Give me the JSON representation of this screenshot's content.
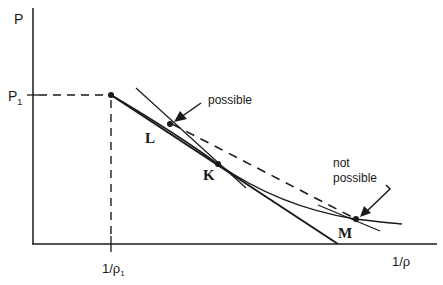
{
  "axes": {
    "y_label": "P",
    "x_label": "1/ρ",
    "y_tick_label": "P",
    "y_tick_sub": "1",
    "x_tick_label": "1/ρ",
    "x_tick_sub": "1"
  },
  "points": {
    "L": "L",
    "K": "K",
    "M": "M"
  },
  "annotations": {
    "possible": "possible",
    "not_line1": "not",
    "not_line2": "possible"
  },
  "colors": {
    "ink": "#1a1a1a",
    "background": "#ffffff"
  }
}
